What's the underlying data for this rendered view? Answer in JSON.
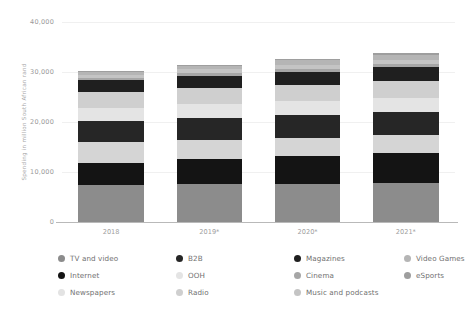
{
  "chart_data": {
    "type": "bar",
    "subtype": "stacked-bar",
    "title": "",
    "xlabel": "",
    "ylabel": "Spending in million South African rand",
    "ylim": [
      0,
      40000
    ],
    "yticks": [
      0,
      10000,
      20000,
      30000,
      40000
    ],
    "ytick_labels": [
      "0",
      "10,000",
      "20,000",
      "30,000",
      "40,000"
    ],
    "grid": true,
    "legend_position": "bottom",
    "categories": [
      "2018",
      "2019*",
      "2020*",
      "2021*"
    ],
    "series": [
      {
        "name": "TV and video",
        "color": "#8c8c8c",
        "values": [
          7400,
          7600,
          7700,
          7800
        ]
      },
      {
        "name": "Internet",
        "color": "#141414",
        "values": [
          4500,
          5000,
          5500,
          6100
        ]
      },
      {
        "name": "Newspapers",
        "color": "#d5d5d5",
        "values": [
          4100,
          3900,
          3700,
          3500
        ]
      },
      {
        "name": "B2B",
        "color": "#262626",
        "values": [
          4300,
          4400,
          4500,
          4600
        ]
      },
      {
        "name": "OOH",
        "color": "#e4e4e4",
        "values": [
          2600,
          2700,
          2800,
          2900
        ]
      },
      {
        "name": "Radio",
        "color": "#cfcfcf",
        "values": [
          3100,
          3200,
          3300,
          3400
        ]
      },
      {
        "name": "Magazines",
        "color": "#1f1f1f",
        "values": [
          2400,
          2500,
          2600,
          2700
        ]
      },
      {
        "name": "Cinema",
        "color": "#a6a6a6",
        "values": [
          500,
          520,
          540,
          560
        ]
      },
      {
        "name": "Music and podcasts",
        "color": "#c4c4c4",
        "values": [
          600,
          700,
          800,
          900
        ]
      },
      {
        "name": "Video Games",
        "color": "#b5b5b5",
        "values": [
          700,
          800,
          900,
          1000
        ]
      },
      {
        "name": "eSports",
        "color": "#9e9e9e",
        "values": [
          100,
          160,
          220,
          300
        ]
      }
    ],
    "totals": [
      30300,
      31480,
      32560,
      33760
    ],
    "annotations": [
      "* indicates forecast values"
    ]
  },
  "axis": {
    "y_title": "Spending in million South African rand"
  },
  "legend": {
    "items": [
      {
        "label": "TV and video",
        "color": "#8c8c8c"
      },
      {
        "label": "Internet",
        "color": "#141414"
      },
      {
        "label": "Newspapers",
        "color": "#e3e3e3"
      },
      {
        "label": "B2B",
        "color": "#262626"
      },
      {
        "label": "OOH",
        "color": "#e4e4e4"
      },
      {
        "label": "Radio",
        "color": "#cfcfcf"
      },
      {
        "label": "Magazines",
        "color": "#1f1f1f"
      },
      {
        "label": "Cinema",
        "color": "#a6a6a6"
      },
      {
        "label": "Music and podcasts",
        "color": "#c4c4c4"
      },
      {
        "label": "Video Games",
        "color": "#b5b5b5"
      },
      {
        "label": "eSports",
        "color": "#9e9e9e"
      }
    ]
  }
}
